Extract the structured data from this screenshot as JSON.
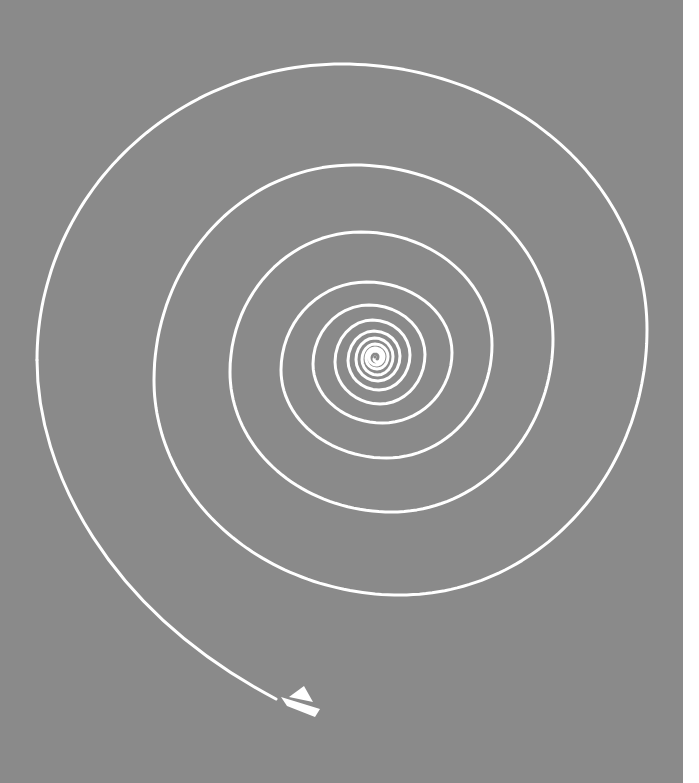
{
  "artwork": {
    "background_color": "#8a8a8a",
    "line_color": "#ffffff",
    "edge_color": "#ffffff",
    "spiral_center": [
      375,
      357
    ],
    "spiral_turns": [
      {
        "left": 37,
        "top": 64,
        "right": 647,
        "bottom": 595
      },
      {
        "left": 154,
        "top": 165,
        "right": 553,
        "bottom": 512
      },
      {
        "left": 230,
        "top": 232,
        "right": 492,
        "bottom": 458
      },
      {
        "left": 281,
        "top": 282,
        "right": 452,
        "bottom": 423
      },
      {
        "left": 313,
        "top": 305,
        "right": 425,
        "bottom": 404
      },
      {
        "left": 335,
        "top": 320,
        "right": 410,
        "bottom": 390
      },
      {
        "left": 348,
        "top": 331,
        "right": 400,
        "bottom": 381
      },
      {
        "left": 356,
        "top": 338,
        "right": 393,
        "bottom": 375
      },
      {
        "left": 362,
        "top": 344,
        "right": 388,
        "bottom": 369
      },
      {
        "left": 366,
        "top": 348,
        "right": 384,
        "bottom": 365
      },
      {
        "left": 369,
        "top": 351,
        "right": 381,
        "bottom": 362
      }
    ],
    "tail": {
      "start": [
        37,
        360
      ],
      "end": [
        276,
        699
      ]
    },
    "boat": {
      "sail": [
        [
          289,
          697
        ],
        [
          304,
          686
        ],
        [
          313,
          702
        ]
      ],
      "hull": [
        [
          281,
          697
        ],
        [
          320,
          709
        ],
        [
          315,
          717
        ],
        [
          287,
          706
        ]
      ]
    }
  }
}
